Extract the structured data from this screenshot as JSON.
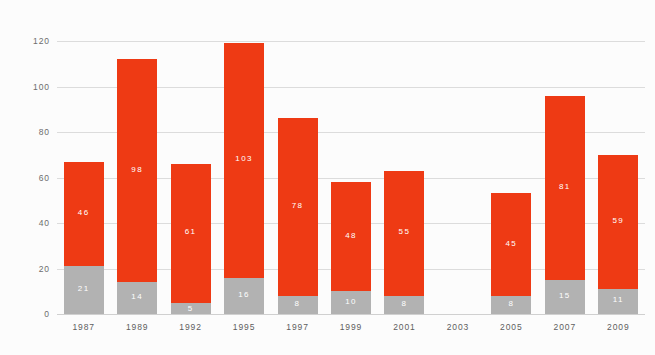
{
  "chart_data": {
    "type": "bar",
    "stacked": true,
    "title": "",
    "subtitle": "",
    "xlabel": "",
    "ylabel": "",
    "ylim": [
      0,
      120
    ],
    "yticks": [
      0,
      20,
      40,
      60,
      80,
      100,
      120
    ],
    "ytick_labels": [
      "0",
      "20",
      "40",
      "60",
      "80",
      "100",
      "120"
    ],
    "grid": true,
    "legend": "none",
    "categories": [
      "1987",
      "1989",
      "1992",
      "1995",
      "1997",
      "1999",
      "2001",
      "2003",
      "2005",
      "2007",
      "2009"
    ],
    "series": [
      {
        "name": "lower-segment",
        "color": "#b2b2b2",
        "values": [
          21,
          14,
          5,
          16,
          8,
          10,
          8,
          null,
          8,
          15,
          11
        ],
        "labels": [
          "21",
          "14",
          "5",
          "16",
          "8",
          "10",
          "8",
          "",
          "8",
          "15",
          "11"
        ]
      },
      {
        "name": "upper-segment",
        "color": "#ee3a14",
        "values": [
          46,
          98,
          61,
          103,
          78,
          48,
          55,
          null,
          45,
          81,
          59
        ],
        "labels": [
          "46",
          "98",
          "61",
          "103",
          "78",
          "48",
          "55",
          "",
          "45",
          "81",
          "59"
        ]
      }
    ],
    "totals": [
      67,
      112,
      66,
      119,
      86,
      58,
      63,
      null,
      53,
      96,
      70
    ],
    "colors": {
      "upper": "#ee3a14",
      "lower": "#b2b2b2",
      "grid": "#dcdcdc",
      "axis_text": "#6d6d6d",
      "background": "#fcfcfc",
      "data_label": "#ffffff"
    }
  }
}
